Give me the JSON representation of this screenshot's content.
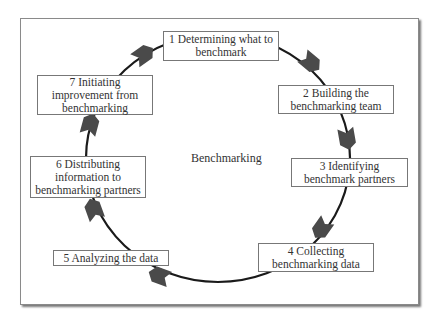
{
  "diagram": {
    "title": "Benchmarking",
    "type": "cycle",
    "steps": [
      {
        "number": 1,
        "label": "1 Determining what to benchmark"
      },
      {
        "number": 2,
        "label": "2 Building the benchmarking team"
      },
      {
        "number": 3,
        "label": "3 Identifying benchmark partners"
      },
      {
        "number": 4,
        "label": "4 Collecting benchmarking data"
      },
      {
        "number": 5,
        "label": "5 Analyzing the data"
      },
      {
        "number": 6,
        "label": "6 Distributing information to benchmarking partners"
      },
      {
        "number": 7,
        "label": "7 Initiating improvement from benchmarking"
      }
    ],
    "colors": {
      "arrow": "#4a4a4a",
      "line": "#1a1a1a",
      "box_border": "#777777",
      "frame_border": "#8a8a8a"
    }
  }
}
